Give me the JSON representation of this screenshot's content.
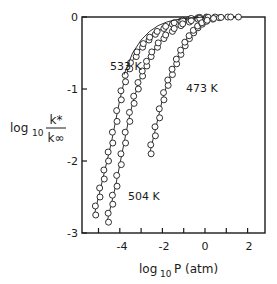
{
  "chart_data": {
    "type": "line",
    "title": "",
    "xlabel": "log10 P (atm)",
    "ylabel": "log10 k*/k∞",
    "xlim": [
      -5.9,
      2.8
    ],
    "ylim": [
      -3,
      0
    ],
    "grid": false,
    "legend": "inline labels",
    "x_ticks": [
      -4,
      -2,
      0,
      2
    ],
    "x_minor_ticks": [
      -5,
      -3,
      -1,
      1
    ],
    "y_ticks": [
      0,
      -1,
      -2,
      -3
    ],
    "series": [
      {
        "name": "533 K",
        "style": "circles with solid fit line",
        "x": [
          -5.2,
          -5.0,
          -4.8,
          -4.6,
          -4.4,
          -4.2,
          -4.0,
          -3.8,
          -3.6,
          -3.3,
          -3.0,
          -2.7,
          -2.4,
          -2.0,
          -1.6,
          -1.2,
          -0.8,
          -0.4,
          0.0
        ],
        "y": [
          -2.75,
          -2.5,
          -2.25,
          -2.0,
          -1.75,
          -1.45,
          -1.15,
          -0.9,
          -0.72,
          -0.55,
          -0.42,
          -0.32,
          -0.24,
          -0.16,
          -0.1,
          -0.06,
          -0.03,
          -0.01,
          0.0
        ]
      },
      {
        "name": "504 K",
        "style": "circles with solid fit line",
        "x": [
          -4.6,
          -4.4,
          -4.2,
          -4.0,
          -3.8,
          -3.6,
          -3.4,
          -3.2,
          -3.0,
          -2.8,
          -2.6,
          -2.3,
          -2.0,
          -1.6,
          -1.2,
          -0.8,
          -0.4,
          0.0,
          0.4
        ],
        "y": [
          -2.85,
          -2.6,
          -2.35,
          -2.05,
          -1.75,
          -1.45,
          -1.2,
          -1.0,
          -0.82,
          -0.68,
          -0.55,
          -0.42,
          -0.3,
          -0.2,
          -0.12,
          -0.07,
          -0.03,
          -0.01,
          0.0
        ]
      },
      {
        "name": "473 K",
        "style": "circles with solid fit line",
        "x": [
          -2.6,
          -2.4,
          -2.2,
          -2.0,
          -1.8,
          -1.6,
          -1.4,
          -1.2,
          -1.0,
          -0.8,
          -0.6,
          -0.4,
          -0.2,
          0.0,
          0.3,
          0.6,
          1.0,
          1.5
        ],
        "y": [
          -1.9,
          -1.65,
          -1.4,
          -1.15,
          -0.95,
          -0.8,
          -0.65,
          -0.52,
          -0.4,
          -0.3,
          -0.22,
          -0.15,
          -0.1,
          -0.06,
          -0.03,
          -0.01,
          0.0,
          0.0
        ]
      },
      {
        "name": "high-pressure limit curve",
        "style": "thin solid line, no markers",
        "x": [
          -3.8,
          -3.4,
          -3.0,
          -2.6,
          -2.2,
          -1.8,
          -1.4,
          -1.0,
          -0.5,
          0.0
        ],
        "y": [
          -0.8,
          -0.5,
          -0.32,
          -0.2,
          -0.12,
          -0.07,
          -0.04,
          -0.02,
          -0.01,
          0.0
        ]
      }
    ],
    "annotations": [
      {
        "text": "533 K",
        "x": -3.9,
        "y": -0.65
      },
      {
        "text": "473 K",
        "x": -1.0,
        "y": -0.85
      },
      {
        "text": "504 K",
        "x": -4.0,
        "y": -2.28
      }
    ]
  },
  "axes": {
    "xlabel_main": "log",
    "xlabel_sub": "10",
    "xlabel_rest": "P (atm)",
    "ylabel_main": "log",
    "ylabel_sub": "10",
    "ylabel_num": "k*",
    "ylabel_den": "k∞",
    "x_tick_labels": [
      "-4",
      "-2",
      "0",
      "2"
    ],
    "y_tick_labels": [
      "0",
      "-1",
      "-2",
      "-3"
    ]
  }
}
